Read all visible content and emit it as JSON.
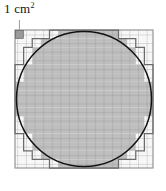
{
  "figure": {
    "label": "1 cm",
    "label_exponent": "2",
    "label_full": "1 cm²",
    "colors": {
      "shaded_fill": "#b9b9b9",
      "unshaded_fill": "#ffffff",
      "fine_grid": "#d2d2d2",
      "major_grid": "#8c8c8c",
      "staircase_outline": "#6b6b6b",
      "circle_stroke": "#111111",
      "label_text": "#141414",
      "reference_cell_fill": "#9a9a9a",
      "pointer_line": "#9a9a9a"
    },
    "grid": {
      "major_cells_across": 16,
      "major_cells_down": 16,
      "subdivisions_per_major_cell": 5,
      "square_left": 15,
      "square_top": 30,
      "square_size": 138,
      "major_cell_px": 8.625
    },
    "circle": {
      "center_x": 84,
      "center_y": 99,
      "radius": 67,
      "stroke_width": 1.4
    },
    "reference_cell": {
      "col": 0,
      "row": 0,
      "note": "single shaded grid square indicating one square centimetre"
    },
    "shaded_rows": [
      {
        "row": 0,
        "start": 5,
        "end": 11
      },
      {
        "row": 1,
        "start": 3,
        "end": 13
      },
      {
        "row": 2,
        "start": 2,
        "end": 14
      },
      {
        "row": 3,
        "start": 2,
        "end": 14
      },
      {
        "row": 4,
        "start": 1,
        "end": 15
      },
      {
        "row": 5,
        "start": 1,
        "end": 15
      },
      {
        "row": 6,
        "start": 0,
        "end": 16
      },
      {
        "row": 7,
        "start": 0,
        "end": 16
      },
      {
        "row": 8,
        "start": 0,
        "end": 16
      },
      {
        "row": 9,
        "start": 0,
        "end": 16
      },
      {
        "row": 10,
        "start": 1,
        "end": 15
      },
      {
        "row": 11,
        "start": 1,
        "end": 15
      },
      {
        "row": 12,
        "start": 2,
        "end": 14
      },
      {
        "row": 13,
        "start": 2,
        "end": 14
      },
      {
        "row": 14,
        "start": 3,
        "end": 13
      },
      {
        "row": 15,
        "start": 5,
        "end": 11
      }
    ],
    "staircase_rows": [
      {
        "row": 0,
        "start": 4,
        "end": 12
      },
      {
        "row": 1,
        "start": 2,
        "end": 14
      },
      {
        "row": 2,
        "start": 1,
        "end": 15
      },
      {
        "row": 3,
        "start": 1,
        "end": 15
      },
      {
        "row": 4,
        "start": 0,
        "end": 16
      },
      {
        "row": 5,
        "start": 0,
        "end": 16
      },
      {
        "row": 6,
        "start": 0,
        "end": 16
      },
      {
        "row": 7,
        "start": 0,
        "end": 16
      },
      {
        "row": 8,
        "start": 0,
        "end": 16
      },
      {
        "row": 9,
        "start": 0,
        "end": 16
      },
      {
        "row": 10,
        "start": 0,
        "end": 16
      },
      {
        "row": 11,
        "start": 0,
        "end": 16
      },
      {
        "row": 12,
        "start": 1,
        "end": 15
      },
      {
        "row": 13,
        "start": 1,
        "end": 15
      },
      {
        "row": 14,
        "start": 2,
        "end": 14
      },
      {
        "row": 15,
        "start": 4,
        "end": 12
      }
    ]
  }
}
